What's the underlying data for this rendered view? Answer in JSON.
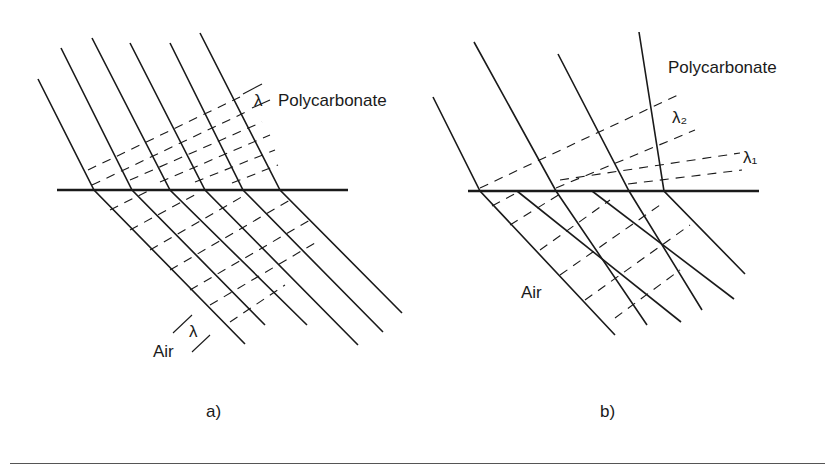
{
  "figure": {
    "panel_a": {
      "caption": "a)",
      "medium_top": "Polycarbonate",
      "medium_bottom": "Air",
      "wavelength_top": "λ",
      "wavelength_bottom": "λ"
    },
    "panel_b": {
      "caption": "b)",
      "medium_top": "Polycarbonate",
      "medium_bottom": "Air",
      "wavelength_1": "λ₁",
      "wavelength_2": "λ₂"
    }
  }
}
